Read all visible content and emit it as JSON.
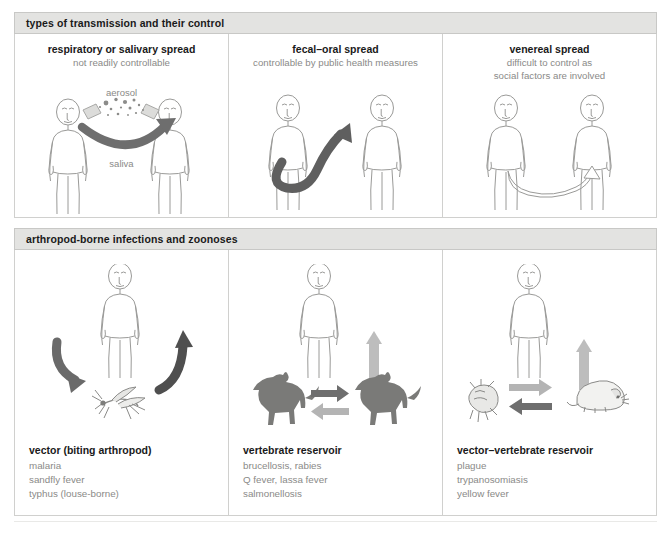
{
  "figure": {
    "caption_clipped": "",
    "colors": {
      "header_bg": "#e3e3e1",
      "border": "#d0d0ce",
      "arrow_dark": "#6e6e6e",
      "arrow_light": "#b4b4b4",
      "figure_outline": "#9a9a98",
      "muted_text": "#8a8a88",
      "title_text": "#1a1a1a"
    }
  },
  "sections": [
    {
      "id": "transmission",
      "header": "types of transmission and their control",
      "columns": [
        {
          "title": "respiratory or salivary spread",
          "subtitle": "not readily controllable",
          "labels": [
            "aerosol",
            "saliva"
          ],
          "icons": [
            "human-figure",
            "aerosol-droplets-icon",
            "curved-arrow-icon",
            "human-figure"
          ]
        },
        {
          "title": "fecal–oral spread",
          "subtitle": "controllable by public health measures",
          "labels": [],
          "icons": [
            "human-figure",
            "s-curve-arrow-icon",
            "human-figure"
          ]
        },
        {
          "title": "venereal spread",
          "subtitle_lines": [
            "difficult to control as",
            "social factors are involved"
          ],
          "labels": [],
          "icons": [
            "human-figure",
            "thin-arc-arrow-icon",
            "human-figure"
          ]
        }
      ]
    },
    {
      "id": "arthropod",
      "header": "arthropod-borne infections and zoonoses",
      "columns": [
        {
          "caption_title": "vector (biting arthropod)",
          "caption_items": [
            "malaria",
            "sandfly fever",
            "typhus (louse-borne)"
          ],
          "icons": [
            "human-figure",
            "curved-arrow-down-icon",
            "mosquito-icon",
            "curved-arrow-up-icon"
          ]
        },
        {
          "caption_title": "vertebrate reservoir",
          "caption_items": [
            "brucellosis, rabies",
            "Q fever, lassa fever",
            "salmonellosis"
          ],
          "icons": [
            "human-figure",
            "up-arrow-icon",
            "dog-icon",
            "right-arrow-icon",
            "left-arrow-icon",
            "dog-icon"
          ]
        },
        {
          "caption_title": "vector–vertebrate reservoir",
          "caption_items": [
            "plague",
            "trypanosomiasis",
            "yellow fever"
          ],
          "icons": [
            "human-figure",
            "up-arrow-icon",
            "flea-icon",
            "right-arrow-icon",
            "left-arrow-icon",
            "rat-icon"
          ]
        }
      ]
    }
  ]
}
